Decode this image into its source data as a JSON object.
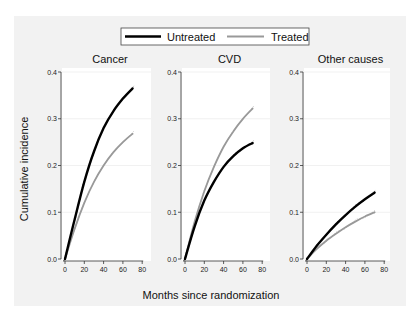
{
  "chart_data": {
    "type": "line",
    "legend": {
      "position": "top",
      "entries": [
        {
          "label": "Untreated",
          "color": "#000000",
          "style": "solid-thick"
        },
        {
          "label": "Treated",
          "color": "#999999",
          "style": "solid"
        }
      ]
    },
    "ylabel": "Cumulative incidence",
    "xlabel": "Months since randomization",
    "ylim": [
      0,
      0.4
    ],
    "xlim": [
      0,
      80
    ],
    "yticks": [
      "0.0",
      "0.1",
      "0.2",
      "0.3",
      "0.4"
    ],
    "xticks": [
      "0",
      "20",
      "40",
      "60",
      "80"
    ],
    "grid": "faint horizontal",
    "panels": [
      {
        "title": "Cancer",
        "x": [
          0,
          10,
          20,
          30,
          40,
          50,
          60,
          70
        ],
        "series": [
          {
            "name": "Untreated",
            "values": [
              0.0,
              0.085,
              0.165,
              0.23,
              0.28,
              0.316,
              0.343,
              0.365
            ]
          },
          {
            "name": "Treated",
            "values": [
              0.0,
              0.065,
              0.12,
              0.165,
              0.2,
              0.228,
              0.25,
              0.268
            ]
          }
        ]
      },
      {
        "title": "CVD",
        "x": [
          0,
          10,
          20,
          30,
          40,
          50,
          60,
          70
        ],
        "series": [
          {
            "name": "Untreated",
            "values": [
              0.0,
              0.07,
              0.125,
              0.165,
              0.197,
              0.22,
              0.237,
              0.248
            ]
          },
          {
            "name": "Treated",
            "values": [
              0.0,
              0.08,
              0.145,
              0.197,
              0.24,
              0.273,
              0.3,
              0.322
            ]
          }
        ]
      },
      {
        "title": "Other causes",
        "x": [
          0,
          10,
          20,
          30,
          40,
          50,
          60,
          70
        ],
        "series": [
          {
            "name": "Untreated",
            "values": [
              0.0,
              0.028,
              0.052,
              0.074,
              0.094,
              0.112,
              0.128,
              0.142
            ]
          },
          {
            "name": "Treated",
            "values": [
              0.0,
              0.021,
              0.039,
              0.054,
              0.068,
              0.08,
              0.091,
              0.1
            ]
          }
        ]
      }
    ]
  }
}
